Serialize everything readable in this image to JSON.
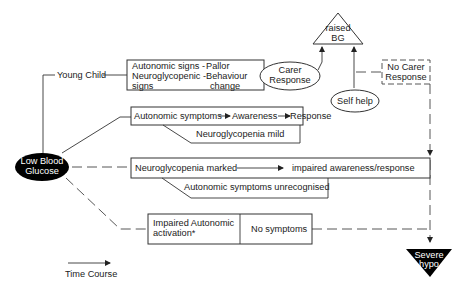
{
  "diagram": {
    "start_node": {
      "line1": "Low Blood",
      "line2": "Glucose"
    },
    "young_child_label": "Young Child",
    "young_child_box": {
      "row1_left": "Autonomic signs -",
      "row1_right": "Pallor",
      "row2_left": "Neuroglycopenic -",
      "row2_right": "Behaviour",
      "row3_left": "signs",
      "row3_right": "change"
    },
    "carer_response": {
      "line1": "Carer",
      "line2": "Response"
    },
    "raised_bg": {
      "line1": "raised",
      "line2": "BG"
    },
    "no_carer_response": {
      "line1": "No Carer",
      "line2": "Response"
    },
    "self_help": "Self help",
    "mild_path": {
      "step1": "Autonomic symptoms",
      "step2": "Awareness",
      "step3": "Response",
      "sub_label": "Neuroglycopenia mild"
    },
    "marked_path": {
      "step1": "Neuroglycopenia marked",
      "step2": "impaired awareness/response",
      "sub_label": "Autonomic symptoms unrecognised"
    },
    "impaired_path": {
      "left_line1": "Impaired Autonomic",
      "left_line2": "activation*",
      "right": "No symptoms"
    },
    "severe_hypo": {
      "line1": "Severe",
      "line2": "hypo"
    },
    "legend": {
      "label": "Time Course"
    },
    "colors": {
      "line": "#333333",
      "fill_dark": "#000000",
      "background": "#ffffff"
    }
  }
}
